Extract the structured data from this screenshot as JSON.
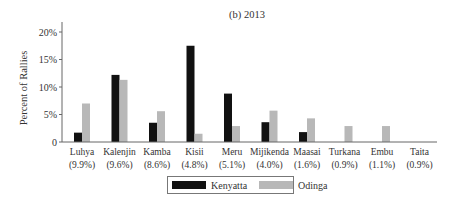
{
  "chart_data": {
    "type": "bar",
    "title": "(b) 2013",
    "xlabel": "",
    "ylabel": "Percent of Rallies",
    "ylim": [
      0,
      20
    ],
    "yticks": [
      "0",
      "5%",
      "10%",
      "15%",
      "20%"
    ],
    "grid": false,
    "legend_position": "bottom",
    "categories": [
      "Luhya",
      "Kalenjin",
      "Kamba",
      "Kisii",
      "Meru",
      "Mijikenda",
      "Maasai",
      "Turkana",
      "Embu",
      "Taita"
    ],
    "category_sublabels": [
      "(9.9%)",
      "(9.6%)",
      "(8.6%)",
      "(4.8%)",
      "(5.1%)",
      "(4.0%)",
      "(1.6%)",
      "(0.9%)",
      "(1.1%)",
      "(0.9%)"
    ],
    "series": [
      {
        "name": "Kenyatta",
        "color": "#111111",
        "values": [
          1.7,
          12.2,
          3.5,
          17.5,
          8.8,
          3.6,
          1.8,
          0,
          0,
          0
        ]
      },
      {
        "name": "Odinga",
        "color": "#b8b8b8",
        "values": [
          7.0,
          11.3,
          5.6,
          1.5,
          2.9,
          5.7,
          4.3,
          2.9,
          2.9,
          0
        ]
      }
    ]
  },
  "legend": {
    "items": [
      {
        "label": "Kenyatta",
        "color": "#111111"
      },
      {
        "label": "Odinga",
        "color": "#b8b8b8"
      }
    ]
  }
}
